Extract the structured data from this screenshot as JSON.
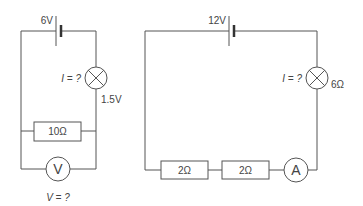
{
  "circuit_a": {
    "battery": {
      "label": "6V"
    },
    "lamp": {
      "current_label": "I = ?",
      "voltage_label": "1.5V"
    },
    "resistor": {
      "label": "10Ω"
    },
    "voltmeter": {
      "symbol": "V",
      "question": "V = ?"
    }
  },
  "circuit_b": {
    "battery": {
      "label": "12V"
    },
    "lamp": {
      "current_label": "I = ?",
      "resistance_label": "6Ω"
    },
    "resistors": [
      {
        "label": "2Ω"
      },
      {
        "label": "2Ω"
      }
    ],
    "ammeter": {
      "symbol": "A"
    }
  },
  "colors": {
    "wire": "#555555",
    "text": "#444444",
    "background": "#ffffff"
  }
}
